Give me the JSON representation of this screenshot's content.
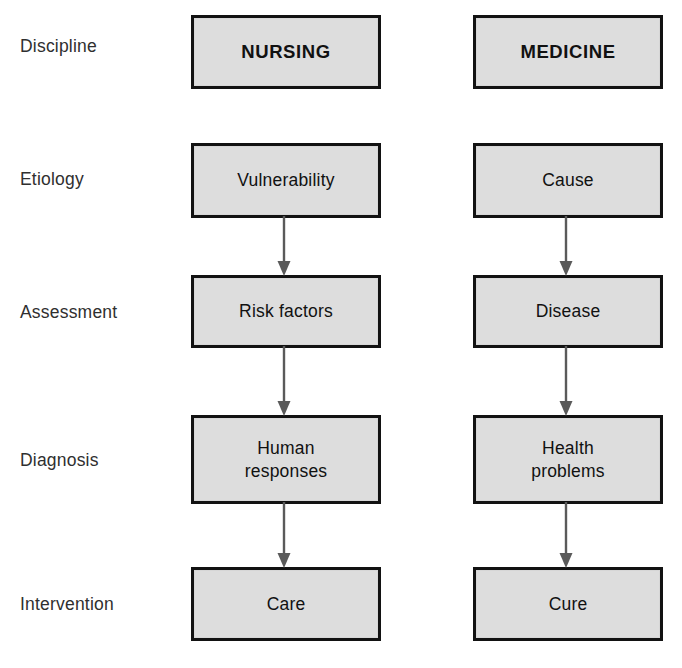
{
  "figure": {
    "columns": [
      "NURSING",
      "MEDICINE"
    ],
    "box_fill": "#dddddd",
    "box_border": "#121212",
    "arrow_color": "#555555",
    "label_color": "#2f2f2f"
  },
  "rows": [
    {
      "label": "Discipline",
      "nursing": "NURSING",
      "medicine": "MEDICINE",
      "heading": true
    },
    {
      "label": "Etiology",
      "nursing": "Vulnerability",
      "medicine": "Cause",
      "heading": false
    },
    {
      "label": "Assessment",
      "nursing": "Risk factors",
      "medicine": "Disease",
      "heading": false
    },
    {
      "label": "Diagnosis",
      "nursing": "Human\nresponses",
      "medicine": "Health\nproblems",
      "heading": false
    },
    {
      "label": "Intervention",
      "nursing": "Care",
      "medicine": "Cure",
      "heading": false
    }
  ]
}
